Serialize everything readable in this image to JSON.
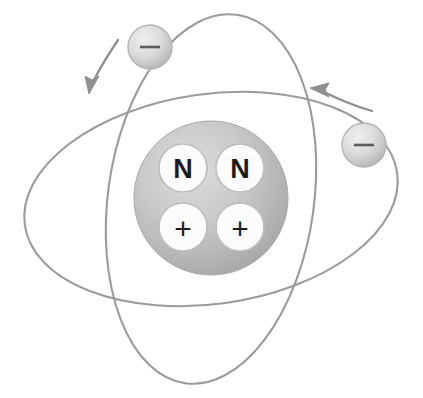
{
  "figure": {
    "background_color": "#ffffff",
    "width": 423,
    "height": 398
  },
  "colors": {
    "orbit_stroke": "#9b9b9b",
    "nucleus_fill_light": "#d8d8d8",
    "nucleus_fill_dark": "#a9a9a9",
    "particle_fill": "#fbfbfb",
    "particle_stroke": "#bdbdbd",
    "particle_text": "#1c1c1c",
    "electron_fill_light": "#e6e6e6",
    "electron_fill_dark": "#b3b3b3",
    "electron_sign": "#5d5d5d",
    "arrow_stroke": "#8f8f8f"
  },
  "nucleus": {
    "label": "nucleus",
    "center_x": 211,
    "center_y": 198,
    "radius": 77,
    "particles": [
      {
        "name": "neutron-1",
        "symbol": "N",
        "kind": "neutron",
        "cx": 183,
        "cy": 168,
        "r": 24
      },
      {
        "name": "neutron-2",
        "symbol": "N",
        "kind": "neutron",
        "cx": 240,
        "cy": 168,
        "r": 24
      },
      {
        "name": "proton-1",
        "symbol": "+",
        "kind": "proton",
        "cx": 183,
        "cy": 227,
        "r": 24
      },
      {
        "name": "proton-2",
        "symbol": "+",
        "kind": "proton",
        "cx": 240,
        "cy": 227,
        "r": 24
      }
    ],
    "neutron_count": 2,
    "proton_count": 2
  },
  "orbits": [
    {
      "name": "orbit-vertical",
      "description": "near-vertical tilted electron orbit",
      "cx": 211,
      "cy": 199,
      "rx": 103,
      "ry": 186,
      "rotation_deg": 8
    },
    {
      "name": "orbit-horizontal",
      "description": "near-horizontal tilted electron orbit",
      "cx": 211,
      "cy": 199,
      "rx": 188,
      "ry": 105,
      "rotation_deg": -8
    }
  ],
  "electrons": [
    {
      "name": "electron-top-left",
      "symbol": "−",
      "charge": "negative",
      "cx": 150,
      "cy": 47,
      "r": 22,
      "on_orbit": "orbit-vertical"
    },
    {
      "name": "electron-right",
      "symbol": "−",
      "charge": "negative",
      "cx": 364,
      "cy": 145,
      "r": 22,
      "on_orbit": "orbit-horizontal"
    }
  ],
  "motion_arrows": [
    {
      "name": "motion-arrow-left",
      "direction": "down-left",
      "describes": "direction of travel of top-left electron"
    },
    {
      "name": "motion-arrow-right",
      "direction": "up-left",
      "describes": "direction of travel of right electron"
    }
  ],
  "legend": {
    "neutron_symbol": "N",
    "proton_symbol": "+",
    "electron_symbol": "−"
  }
}
